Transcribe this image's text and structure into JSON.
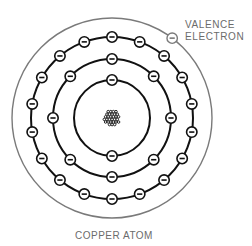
{
  "diagram": {
    "title": "COPPER ATOM",
    "annotation": {
      "line1": "VALENCE",
      "line2": "ELECTRON"
    },
    "center": [
      112,
      118
    ],
    "nucleus": {
      "radius": 9
    },
    "shells": [
      {
        "name": "shell-1",
        "radius": 38,
        "electrons": 2,
        "start_angle": -90,
        "color": "#111111"
      },
      {
        "name": "shell-2",
        "radius": 59,
        "electrons": 8,
        "start_angle": -90,
        "color": "#111111"
      },
      {
        "name": "shell-3",
        "radius": 81,
        "electrons": 18,
        "start_angle": -90,
        "color": "#111111"
      },
      {
        "name": "valence-shell",
        "radius": 100,
        "electrons": 1,
        "start_angle": -53,
        "color": "#7a7a7a"
      }
    ],
    "electron_symbol": "−",
    "colors": {
      "orbit": "#111111",
      "valence_orbit": "#7a7a7a",
      "label": "#6b6b6b"
    }
  }
}
